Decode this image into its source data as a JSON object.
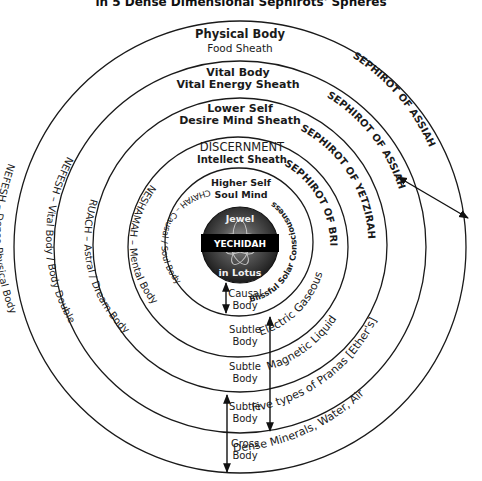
{
  "title": "in 5 Dense Dimensional Sephirots' Spheres",
  "sheaths": [
    {
      "name": "Physical Body",
      "sheath": "Food Sheath"
    },
    {
      "name": "Vital Body",
      "sheath": "Vital Energy Sheath"
    },
    {
      "name": "Lower Self",
      "sheath": "Desire Mind Sheath"
    },
    {
      "name": "DISCERNMENT",
      "sheath": "Intellect Sheath"
    },
    {
      "name": "Higher Self",
      "sheath": "Soul Mind"
    }
  ],
  "left_labels": [
    "NEFESH –  Dense Physical Body",
    "NEFESH – Vital Body / Body Double",
    "RUACH –  Astral / Dream  Body",
    "NESHAMAH – Mental Body",
    "CHAYAH – Causal / Soul Body"
  ],
  "sephirot_labels": [
    "SEPHIROT OF ASSIAH",
    "SEPHIROT OF ASSIAH",
    "SEPHIROT OF YETZIRAH",
    "SEPHIROT OF BRIAH"
  ],
  "inner_right_label": "Blissful Solar Consciousness",
  "element_labels": [
    "Dense Minerals, Water, Air",
    "Five types of Pranas [Ether's]",
    "Magnetic Liquid",
    "Electric Gaseous"
  ],
  "core": {
    "top": "Jewel",
    "band": "YECHIDAH",
    "bottom": "in Lotus"
  },
  "bodies": [
    {
      "line1": "Causal",
      "line2": "Body"
    },
    {
      "line1": "Subtle",
      "line2": "Body"
    },
    {
      "line1": "Subtle",
      "line2": "Body"
    },
    {
      "line1": "Subtle",
      "line2": "Body"
    },
    {
      "line1": "Gross",
      "line2": "Body"
    }
  ],
  "colors": {
    "line": "#1a1a1a",
    "background": "#ffffff",
    "core_band": "#000000",
    "core_fill": "#3a3a3a"
  }
}
